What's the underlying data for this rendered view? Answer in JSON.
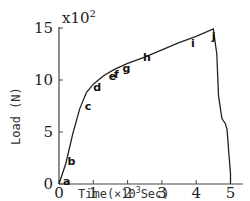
{
  "chart_data": {
    "type": "line",
    "title": "",
    "xlabel": "Time(×10³Sec)",
    "ylabel": "Load (N)",
    "y_multiplier": "x10²",
    "xlim": [
      0,
      5.5
    ],
    "ylim": [
      0,
      15
    ],
    "x_ticks": [
      "0",
      "1",
      "2",
      "3",
      "4",
      "5"
    ],
    "y_ticks": [
      "0",
      "5",
      "10",
      "15"
    ],
    "grid": false,
    "legend": null,
    "series": [
      {
        "name": "Load",
        "x": [
          0,
          0.2,
          0.4,
          0.6,
          0.8,
          1.0,
          1.3,
          1.6,
          2.0,
          2.5,
          3.0,
          3.5,
          4.0,
          4.5,
          4.6,
          4.65,
          4.75,
          4.85,
          4.9,
          4.95,
          5.0,
          5.0
        ],
        "y": [
          0,
          2,
          4.8,
          7.2,
          8.8,
          9.6,
          10.4,
          11.0,
          11.6,
          12.2,
          12.9,
          13.6,
          14.2,
          14.9,
          12.5,
          8.5,
          6.3,
          5.8,
          5.2,
          3.0,
          1.0,
          0
        ]
      }
    ],
    "annotations": [
      {
        "label": "a",
        "x": 0.12,
        "y": 0.3
      },
      {
        "label": "b",
        "x": 0.25,
        "y": 2.2
      },
      {
        "label": "c",
        "x": 0.75,
        "y": 7.5
      },
      {
        "label": "d",
        "x": 1.0,
        "y": 9.3
      },
      {
        "label": "e",
        "x": 1.45,
        "y": 10.4
      },
      {
        "label": "f",
        "x": 1.6,
        "y": 10.6
      },
      {
        "label": "g",
        "x": 1.85,
        "y": 11.2
      },
      {
        "label": "h",
        "x": 2.45,
        "y": 12.2
      },
      {
        "label": "i",
        "x": 3.85,
        "y": 13.6
      },
      {
        "label": "j",
        "x": 4.45,
        "y": 14.2
      }
    ]
  },
  "labels": {
    "xlabel": "Time(×10",
    "xlabel_exp": "3",
    "xlabel_unit": "Sec)",
    "ylabel": "Load (N)",
    "ymult": "x10",
    "ymult_exp": "2"
  }
}
